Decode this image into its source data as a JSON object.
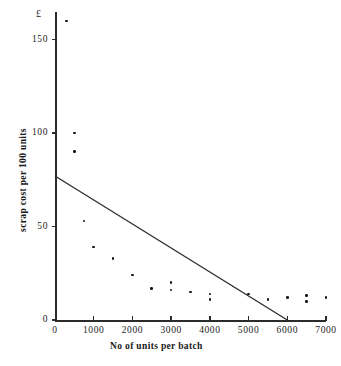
{
  "figure": {
    "background_color": "#ffffff",
    "ink_color": "#1a1a1a"
  },
  "axes": {
    "currency_marker": "£",
    "x_title": "No of units per batch",
    "y_title": "scrap cost  per 100 units",
    "x_ticks": [
      "0",
      "1000",
      "2000",
      "3000",
      "4000",
      "5000",
      "6000",
      "7000"
    ],
    "y_ticks": [
      "0",
      "50",
      "100",
      "150"
    ]
  },
  "chart_data": {
    "type": "scatter",
    "title": "",
    "subtitle": "",
    "xlabel": "No of units per batch",
    "ylabel": "scrap cost per 100 units",
    "y_unit": "£",
    "xlim": [
      0,
      7000
    ],
    "ylim": [
      0,
      165
    ],
    "xticks": [
      0,
      1000,
      2000,
      3000,
      4000,
      5000,
      6000,
      7000
    ],
    "yticks": [
      0,
      50,
      100,
      150
    ],
    "grid": false,
    "legend": null,
    "legend_position": "none",
    "marker": "dot",
    "marker_color": "#161616",
    "series": [
      {
        "name": "scrap cost observations",
        "type": "scatter",
        "points": [
          [
            300,
            160
          ],
          [
            500,
            100
          ],
          [
            500,
            90
          ],
          [
            750,
            53
          ],
          [
            1000,
            39
          ],
          [
            1500,
            33
          ],
          [
            2000,
            24
          ],
          [
            2500,
            17
          ],
          [
            3000,
            20
          ],
          [
            3000,
            16
          ],
          [
            3500,
            15
          ],
          [
            4000,
            14
          ],
          [
            4000,
            11
          ],
          [
            5000,
            14
          ],
          [
            5500,
            11
          ],
          [
            6000,
            12
          ],
          [
            6500,
            13
          ],
          [
            6500,
            10
          ],
          [
            7000,
            12
          ]
        ]
      },
      {
        "name": "fitted straight line",
        "type": "line",
        "color": "#2b2b2b",
        "points": [
          [
            0,
            77
          ],
          [
            6000,
            0
          ]
        ]
      }
    ]
  }
}
